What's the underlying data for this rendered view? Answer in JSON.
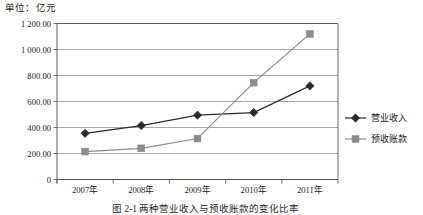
{
  "unit_note": "单位：亿元",
  "caption": "图 2-1  两种营业收入与预收账款的变化比率",
  "colors": {
    "series_revenue": "#2b2b2b",
    "series_advance": "#8c8c8c",
    "gridline": "#808080",
    "axis": "#4d4d4d"
  },
  "chart_data": {
    "type": "line",
    "title": "",
    "subtitle": "",
    "xlabel": "",
    "ylabel": "单位：亿元",
    "categories": [
      "2007年",
      "2008年",
      "2009年",
      "2010年",
      "2011年"
    ],
    "ytick_labels": [
      "0",
      "200.00",
      "400.00",
      "600.00",
      "800.00",
      "1 000.00",
      "1 200.00"
    ],
    "ytick_values": [
      0,
      200,
      400,
      600,
      800,
      1000,
      1200
    ],
    "ylim": [
      0,
      1200
    ],
    "grid": true,
    "legend_position": "right",
    "series": [
      {
        "name": "营业收入",
        "marker": "diamond",
        "color": "#2b2b2b",
        "values": [
          355,
          415,
          495,
          515,
          720
        ]
      },
      {
        "name": "预收账款",
        "marker": "square",
        "color": "#8c8c8c",
        "values": [
          215,
          240,
          315,
          745,
          1120
        ]
      }
    ]
  }
}
